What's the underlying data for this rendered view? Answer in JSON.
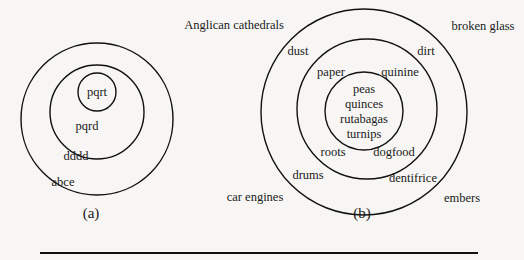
{
  "figure_a": {
    "caption": "(a)",
    "rings": [
      {
        "label": "pqrt",
        "level": "inner"
      },
      {
        "label": "pqrd",
        "level": "middle"
      },
      {
        "label": "dddd",
        "level": "outer"
      },
      {
        "label": "abce",
        "level": "outside"
      }
    ]
  },
  "figure_b": {
    "caption": "(b)",
    "inner": [
      "peas",
      "quinces",
      "rutabagas",
      "turnips"
    ],
    "middle": [
      "paper",
      "quinine",
      "roots",
      "dogfood"
    ],
    "outer": [
      "dust",
      "dirt",
      "drums",
      "dentifrice"
    ],
    "outside": [
      "Anglican cathedrals",
      "broken glass",
      "car engines",
      "embers"
    ]
  },
  "colors": {
    "ink": "#1a1a1a",
    "paper": "#f7f6f4"
  }
}
